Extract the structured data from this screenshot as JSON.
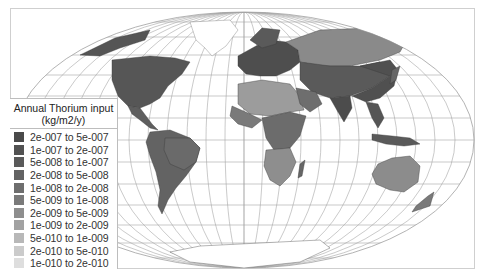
{
  "map": {
    "projection": "Hammer-Aitoff world map",
    "background": "#ffffff",
    "graticule_color": "#9a9a9a",
    "ocean_color": "#ffffff"
  },
  "legend": {
    "title_line1": "Annual Thorium input",
    "title_line2": "(kg/m2/y)",
    "items": [
      {
        "label": "2e-007 to 5e-007",
        "color": "#4a4a4a"
      },
      {
        "label": "1e-007 to 2e-007",
        "color": "#525252"
      },
      {
        "label": "5e-008 to 1e-007",
        "color": "#5a5a5a"
      },
      {
        "label": "2e-008 to 5e-008",
        "color": "#636363"
      },
      {
        "label": "1e-008 to 2e-008",
        "color": "#6e6e6e"
      },
      {
        "label": "5e-009 to 1e-008",
        "color": "#7a7a7a"
      },
      {
        "label": "2e-009 to 5e-009",
        "color": "#8e8e8e"
      },
      {
        "label": "1e-009 to 2e-009",
        "color": "#a2a2a2"
      },
      {
        "label": "5e-010 to 1e-009",
        "color": "#b8b8b8"
      },
      {
        "label": "2e-010 to 5e-010",
        "color": "#cbcbcb"
      },
      {
        "label": "1e-010 to 2e-010",
        "color": "#dedede"
      }
    ]
  }
}
